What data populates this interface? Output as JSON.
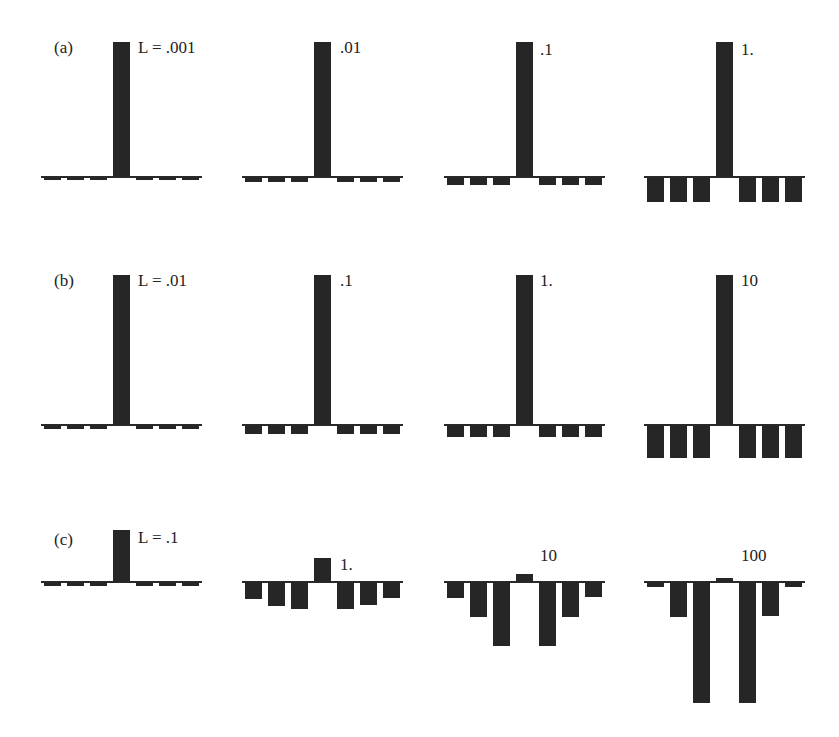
{
  "rows": [
    {
      "label": "(a)",
      "panels": [
        {
          "L": "L = .001"
        },
        {
          "L": ".01"
        },
        {
          "L": ".1"
        },
        {
          "L": "1."
        }
      ]
    },
    {
      "label": "(b)",
      "panels": [
        {
          "L": "L = .01"
        },
        {
          "L": ".1"
        },
        {
          "L": "1."
        },
        {
          "L": "10"
        }
      ]
    },
    {
      "label": "(c)",
      "panels": [
        {
          "L": "L = .1"
        },
        {
          "L": "1."
        },
        {
          "L": "10"
        },
        {
          "L": "100"
        }
      ]
    }
  ],
  "chart_data": {
    "type": "bar",
    "title": "",
    "xlabel": "",
    "ylabel": "",
    "grid": false,
    "note": "Array of 12 small stem/bar plots, 7 bars each (center bar is index 3). Heights in relative units where the center bar of rows a/b is ~135.",
    "categories": [
      -3,
      -2,
      -1,
      0,
      1,
      2,
      3
    ],
    "panels": [
      {
        "row": "(a)",
        "L": 0.001,
        "values": [
          -3,
          -3,
          -3,
          135,
          -3,
          -3,
          -3
        ]
      },
      {
        "row": "(a)",
        "L": 0.01,
        "values": [
          -5,
          -5,
          -5,
          135,
          -5,
          -5,
          -5
        ]
      },
      {
        "row": "(a)",
        "L": 0.1,
        "values": [
          -8,
          -8,
          -8,
          135,
          -8,
          -8,
          -8
        ]
      },
      {
        "row": "(a)",
        "L": 1,
        "values": [
          -25,
          -25,
          -25,
          135,
          -25,
          -25,
          -25
        ]
      },
      {
        "row": "(b)",
        "L": 0.01,
        "values": [
          -4,
          -4,
          -4,
          150,
          -4,
          -4,
          -4
        ]
      },
      {
        "row": "(b)",
        "L": 0.1,
        "values": [
          -9,
          -9,
          -9,
          150,
          -9,
          -9,
          -9
        ]
      },
      {
        "row": "(b)",
        "L": 1,
        "values": [
          -12,
          -12,
          -12,
          150,
          -12,
          -12,
          -12
        ]
      },
      {
        "row": "(b)",
        "L": 10,
        "values": [
          -33,
          -33,
          -33,
          150,
          -33,
          -33,
          -33
        ]
      },
      {
        "row": "(c)",
        "L": 0.1,
        "values": [
          -4,
          -4,
          -4,
          52,
          -4,
          -4,
          -4
        ]
      },
      {
        "row": "(c)",
        "L": 1,
        "values": [
          -17,
          -24,
          -27,
          24,
          -27,
          -23,
          -16
        ]
      },
      {
        "row": "(c)",
        "L": 10,
        "values": [
          -16,
          -35,
          -64,
          8,
          -64,
          -35,
          -15
        ]
      },
      {
        "row": "(c)",
        "L": 100,
        "values": [
          -5,
          -35,
          -121,
          4,
          -121,
          -34,
          -5
        ]
      }
    ]
  }
}
